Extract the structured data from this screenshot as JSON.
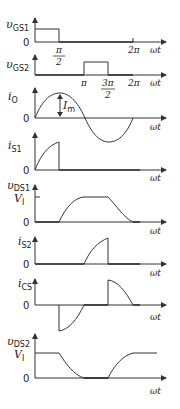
{
  "diagram": {
    "type": "switching-waveforms",
    "x_axis_label": "ωt",
    "zero_label": "0",
    "ticks": {
      "pi_over_2": "π",
      "pi_over_2_den": "2",
      "pi": "π",
      "three_pi_over_2_num": "3π",
      "three_pi_over_2_den": "2",
      "two_pi": "2π"
    },
    "plots": [
      {
        "id": "vgs1",
        "symbol": "υ",
        "subscript": "GS1"
      },
      {
        "id": "vgs2",
        "symbol": "υ",
        "subscript": "GS2"
      },
      {
        "id": "io",
        "symbol": "i",
        "subscript": "O",
        "annotation": "I",
        "annotation_sub": "m"
      },
      {
        "id": "is1",
        "symbol": "i",
        "subscript": "S1"
      },
      {
        "id": "vds1",
        "symbol": "υ",
        "subscript": "DS1",
        "level_label": "V",
        "level_sub": "I"
      },
      {
        "id": "is2",
        "symbol": "i",
        "subscript": "S2"
      },
      {
        "id": "ics",
        "symbol": "i",
        "subscript": "CS"
      },
      {
        "id": "vds2",
        "symbol": "υ",
        "subscript": "DS2",
        "level_label": "V",
        "level_sub": "I"
      }
    ]
  }
}
